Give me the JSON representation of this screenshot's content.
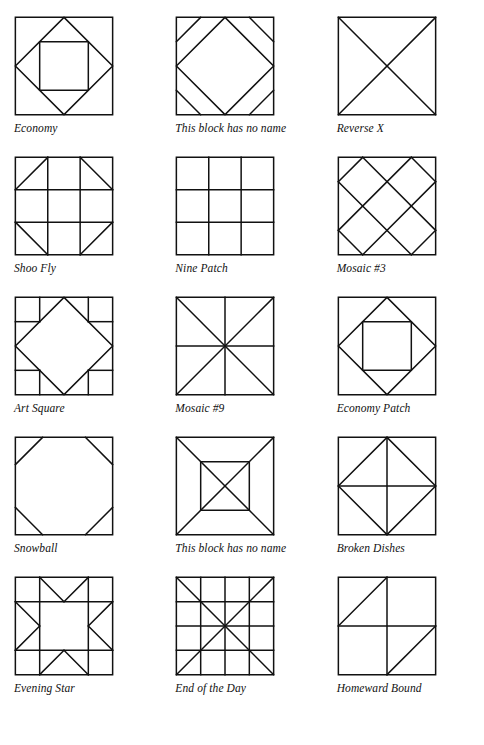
{
  "page": {
    "background_color": "#ffffff",
    "ink_color": "#111111",
    "columns": 3,
    "rows": 5
  },
  "blocks": [
    {
      "name": "Economy",
      "caption": "Economy",
      "shapes": [
        {
          "type": "rect",
          "x": 0,
          "y": 0,
          "w": 100,
          "h": 100
        },
        {
          "type": "poly",
          "points": "50,0 100,50 50,100 0,50"
        },
        {
          "type": "rect",
          "x": 25,
          "y": 25,
          "w": 50,
          "h": 50
        }
      ]
    },
    {
      "name": "This block has no name (diamond with corner bars)",
      "caption": "This block has no name",
      "shapes": [
        {
          "type": "rect",
          "x": 0,
          "y": 0,
          "w": 100,
          "h": 100
        },
        {
          "type": "poly",
          "points": "50,0 100,50 50,100 0,50"
        },
        {
          "type": "line",
          "x1": 25,
          "y1": 0,
          "x2": 0,
          "y2": 25
        },
        {
          "type": "line",
          "x1": 75,
          "y1": 0,
          "x2": 100,
          "y2": 25
        },
        {
          "type": "line",
          "x1": 0,
          "y1": 75,
          "x2": 25,
          "y2": 100
        },
        {
          "type": "line",
          "x1": 100,
          "y1": 75,
          "x2": 75,
          "y2": 100
        }
      ]
    },
    {
      "name": "Reverse X",
      "caption": "Reverse X",
      "shapes": [
        {
          "type": "rect",
          "x": 0,
          "y": 0,
          "w": 100,
          "h": 100
        },
        {
          "type": "line",
          "x1": 0,
          "y1": 0,
          "x2": 100,
          "y2": 100
        },
        {
          "type": "line",
          "x1": 100,
          "y1": 0,
          "x2": 0,
          "y2": 100
        }
      ]
    },
    {
      "name": "Shoo Fly",
      "caption": "Shoo Fly",
      "shapes": [
        {
          "type": "rect",
          "x": 0,
          "y": 0,
          "w": 100,
          "h": 100
        },
        {
          "type": "line",
          "x1": 0,
          "y1": 33.3,
          "x2": 100,
          "y2": 33.3
        },
        {
          "type": "line",
          "x1": 0,
          "y1": 66.6,
          "x2": 100,
          "y2": 66.6
        },
        {
          "type": "line",
          "x1": 33.3,
          "y1": 0,
          "x2": 33.3,
          "y2": 100
        },
        {
          "type": "line",
          "x1": 66.6,
          "y1": 0,
          "x2": 66.6,
          "y2": 100
        },
        {
          "type": "line",
          "x1": 33.3,
          "y1": 0,
          "x2": 0,
          "y2": 33.3
        },
        {
          "type": "line",
          "x1": 66.6,
          "y1": 0,
          "x2": 100,
          "y2": 33.3
        },
        {
          "type": "line",
          "x1": 0,
          "y1": 66.6,
          "x2": 33.3,
          "y2": 100
        },
        {
          "type": "line",
          "x1": 100,
          "y1": 66.6,
          "x2": 66.6,
          "y2": 100
        }
      ]
    },
    {
      "name": "Nine Patch",
      "caption": "Nine Patch",
      "shapes": [
        {
          "type": "rect",
          "x": 0,
          "y": 0,
          "w": 100,
          "h": 100
        },
        {
          "type": "line",
          "x1": 0,
          "y1": 33.3,
          "x2": 100,
          "y2": 33.3
        },
        {
          "type": "line",
          "x1": 0,
          "y1": 66.6,
          "x2": 100,
          "y2": 66.6
        },
        {
          "type": "line",
          "x1": 33.3,
          "y1": 0,
          "x2": 33.3,
          "y2": 100
        },
        {
          "type": "line",
          "x1": 66.6,
          "y1": 0,
          "x2": 66.6,
          "y2": 100
        }
      ]
    },
    {
      "name": "Mosaic #3",
      "caption": "Mosaic #3",
      "shapes": [
        {
          "type": "rect",
          "x": 0,
          "y": 0,
          "w": 100,
          "h": 100
        },
        {
          "type": "line",
          "x1": 0,
          "y1": 25,
          "x2": 75,
          "y2": 100
        },
        {
          "type": "line",
          "x1": 0,
          "y1": 75,
          "x2": 25,
          "y2": 100
        },
        {
          "type": "line",
          "x1": 25,
          "y1": 0,
          "x2": 100,
          "y2": 75
        },
        {
          "type": "line",
          "x1": 75,
          "y1": 0,
          "x2": 100,
          "y2": 25
        },
        {
          "type": "line",
          "x1": 25,
          "y1": 0,
          "x2": 0,
          "y2": 25
        },
        {
          "type": "line",
          "x1": 75,
          "y1": 0,
          "x2": 0,
          "y2": 75
        },
        {
          "type": "line",
          "x1": 100,
          "y1": 25,
          "x2": 25,
          "y2": 100
        },
        {
          "type": "line",
          "x1": 100,
          "y1": 75,
          "x2": 75,
          "y2": 100
        }
      ]
    },
    {
      "name": "Art Square",
      "caption": "Art Square",
      "shapes": [
        {
          "type": "rect",
          "x": 0,
          "y": 0,
          "w": 100,
          "h": 100
        },
        {
          "type": "poly",
          "points": "50,0 100,50 50,100 0,50"
        },
        {
          "type": "line",
          "x1": 0,
          "y1": 25,
          "x2": 25,
          "y2": 25
        },
        {
          "type": "line",
          "x1": 25,
          "y1": 0,
          "x2": 25,
          "y2": 25
        },
        {
          "type": "line",
          "x1": 75,
          "y1": 0,
          "x2": 75,
          "y2": 25
        },
        {
          "type": "line",
          "x1": 75,
          "y1": 25,
          "x2": 100,
          "y2": 25
        },
        {
          "type": "line",
          "x1": 0,
          "y1": 75,
          "x2": 25,
          "y2": 75
        },
        {
          "type": "line",
          "x1": 25,
          "y1": 75,
          "x2": 25,
          "y2": 100
        },
        {
          "type": "line",
          "x1": 75,
          "y1": 75,
          "x2": 100,
          "y2": 75
        },
        {
          "type": "line",
          "x1": 75,
          "y1": 75,
          "x2": 75,
          "y2": 100
        }
      ]
    },
    {
      "name": "Mosaic #9",
      "caption": "Mosaic #9",
      "shapes": [
        {
          "type": "rect",
          "x": 0,
          "y": 0,
          "w": 100,
          "h": 100
        },
        {
          "type": "line",
          "x1": 0,
          "y1": 0,
          "x2": 100,
          "y2": 100
        },
        {
          "type": "line",
          "x1": 100,
          "y1": 0,
          "x2": 0,
          "y2": 100
        },
        {
          "type": "line",
          "x1": 50,
          "y1": 0,
          "x2": 50,
          "y2": 100
        },
        {
          "type": "line",
          "x1": 0,
          "y1": 50,
          "x2": 100,
          "y2": 50
        }
      ]
    },
    {
      "name": "Economy Patch",
      "caption": "Economy Patch",
      "shapes": [
        {
          "type": "rect",
          "x": 0,
          "y": 0,
          "w": 100,
          "h": 100
        },
        {
          "type": "poly",
          "points": "50,0 100,50 50,100 0,50"
        },
        {
          "type": "rect",
          "x": 25,
          "y": 25,
          "w": 50,
          "h": 50
        }
      ]
    },
    {
      "name": "Snowball",
      "caption": "Snowball",
      "shapes": [
        {
          "type": "rect",
          "x": 0,
          "y": 0,
          "w": 100,
          "h": 100
        },
        {
          "type": "line",
          "x1": 28,
          "y1": 0,
          "x2": 0,
          "y2": 28
        },
        {
          "type": "line",
          "x1": 72,
          "y1": 0,
          "x2": 100,
          "y2": 28
        },
        {
          "type": "line",
          "x1": 0,
          "y1": 72,
          "x2": 28,
          "y2": 100
        },
        {
          "type": "line",
          "x1": 100,
          "y1": 72,
          "x2": 72,
          "y2": 100
        }
      ]
    },
    {
      "name": "This block has no name (square in square with X)",
      "caption": "This block has no name",
      "shapes": [
        {
          "type": "rect",
          "x": 0,
          "y": 0,
          "w": 100,
          "h": 100
        },
        {
          "type": "rect",
          "x": 25,
          "y": 25,
          "w": 50,
          "h": 50
        },
        {
          "type": "line",
          "x1": 0,
          "y1": 0,
          "x2": 100,
          "y2": 100
        },
        {
          "type": "line",
          "x1": 100,
          "y1": 0,
          "x2": 0,
          "y2": 100
        }
      ]
    },
    {
      "name": "Broken Dishes",
      "caption": "Broken Dishes",
      "shapes": [
        {
          "type": "rect",
          "x": 0,
          "y": 0,
          "w": 100,
          "h": 100
        },
        {
          "type": "poly",
          "points": "50,0 100,50 50,100 0,50"
        },
        {
          "type": "line",
          "x1": 50,
          "y1": 0,
          "x2": 50,
          "y2": 100
        },
        {
          "type": "line",
          "x1": 0,
          "y1": 50,
          "x2": 100,
          "y2": 50
        }
      ]
    },
    {
      "name": "Evening Star",
      "caption": "Evening Star",
      "shapes": [
        {
          "type": "rect",
          "x": 0,
          "y": 0,
          "w": 100,
          "h": 100
        },
        {
          "type": "line",
          "x1": 0,
          "y1": 25,
          "x2": 100,
          "y2": 25
        },
        {
          "type": "line",
          "x1": 0,
          "y1": 75,
          "x2": 100,
          "y2": 75
        },
        {
          "type": "line",
          "x1": 25,
          "y1": 0,
          "x2": 25,
          "y2": 100
        },
        {
          "type": "line",
          "x1": 75,
          "y1": 0,
          "x2": 75,
          "y2": 100
        },
        {
          "type": "line",
          "x1": 25,
          "y1": 0,
          "x2": 50,
          "y2": 25
        },
        {
          "type": "line",
          "x1": 75,
          "y1": 0,
          "x2": 50,
          "y2": 25
        },
        {
          "type": "line",
          "x1": 25,
          "y1": 100,
          "x2": 50,
          "y2": 75
        },
        {
          "type": "line",
          "x1": 75,
          "y1": 100,
          "x2": 50,
          "y2": 75
        },
        {
          "type": "line",
          "x1": 0,
          "y1": 25,
          "x2": 25,
          "y2": 50
        },
        {
          "type": "line",
          "x1": 0,
          "y1": 75,
          "x2": 25,
          "y2": 50
        },
        {
          "type": "line",
          "x1": 100,
          "y1": 25,
          "x2": 75,
          "y2": 50
        },
        {
          "type": "line",
          "x1": 100,
          "y1": 75,
          "x2": 75,
          "y2": 50
        }
      ]
    },
    {
      "name": "End of the Day",
      "caption": "End of the Day",
      "shapes": [
        {
          "type": "rect",
          "x": 0,
          "y": 0,
          "w": 100,
          "h": 100
        },
        {
          "type": "line",
          "x1": 0,
          "y1": 25,
          "x2": 100,
          "y2": 25
        },
        {
          "type": "line",
          "x1": 0,
          "y1": 50,
          "x2": 100,
          "y2": 50
        },
        {
          "type": "line",
          "x1": 0,
          "y1": 75,
          "x2": 100,
          "y2": 75
        },
        {
          "type": "line",
          "x1": 25,
          "y1": 0,
          "x2": 25,
          "y2": 100
        },
        {
          "type": "line",
          "x1": 50,
          "y1": 0,
          "x2": 50,
          "y2": 100
        },
        {
          "type": "line",
          "x1": 75,
          "y1": 0,
          "x2": 75,
          "y2": 100
        },
        {
          "type": "line",
          "x1": 0,
          "y1": 0,
          "x2": 100,
          "y2": 100
        },
        {
          "type": "line",
          "x1": 100,
          "y1": 0,
          "x2": 0,
          "y2": 100
        }
      ]
    },
    {
      "name": "Homeward Bound",
      "caption": "Homeward Bound",
      "shapes": [
        {
          "type": "rect",
          "x": 0,
          "y": 0,
          "w": 100,
          "h": 100
        },
        {
          "type": "line",
          "x1": 0,
          "y1": 50,
          "x2": 100,
          "y2": 50
        },
        {
          "type": "line",
          "x1": 50,
          "y1": 0,
          "x2": 50,
          "y2": 100
        },
        {
          "type": "line",
          "x1": 0,
          "y1": 50,
          "x2": 50,
          "y2": 0
        },
        {
          "type": "line",
          "x1": 50,
          "y1": 100,
          "x2": 100,
          "y2": 50
        }
      ]
    }
  ]
}
